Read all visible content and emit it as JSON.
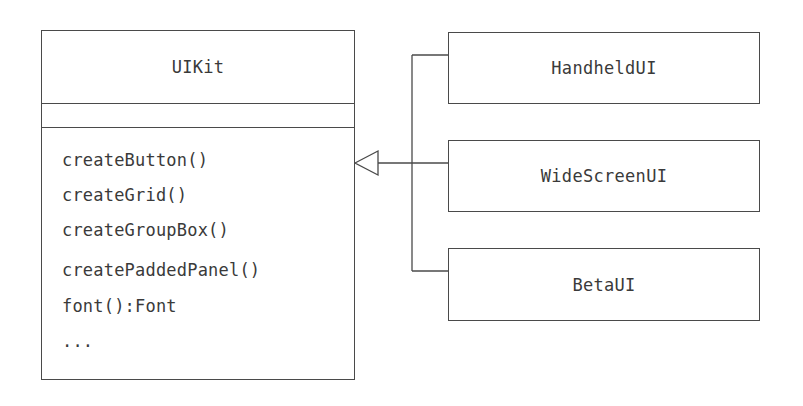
{
  "diagram": {
    "type": "uml-class-diagram",
    "superclass": {
      "name": "UIKit",
      "attributes": [],
      "methods": [
        "createButton()",
        "createGrid()",
        "createGroupBox()",
        "createPaddedPanel()",
        "font():Font",
        "..."
      ]
    },
    "subclasses": [
      {
        "name": "HandheldUI"
      },
      {
        "name": "WideScreenUI"
      },
      {
        "name": "BetaUI"
      }
    ],
    "relationship": "generalization",
    "colors": {
      "line": "#4a4a4a",
      "text": "#3a3a3a",
      "background": "#ffffff"
    }
  }
}
